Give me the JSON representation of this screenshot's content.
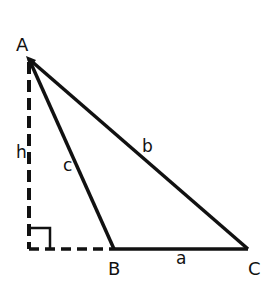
{
  "diagram": {
    "type": "triangle-altitude",
    "colors": {
      "stroke": "#111111",
      "background": "#ffffff"
    },
    "vertices": {
      "A": {
        "label": "A",
        "x": 29,
        "y": 59
      },
      "B": {
        "label": "B",
        "x": 114,
        "y": 249
      },
      "C": {
        "label": "C",
        "x": 248,
        "y": 249
      },
      "H": {
        "x": 29,
        "y": 249
      }
    },
    "sides": {
      "a": {
        "label": "a"
      },
      "b": {
        "label": "b"
      },
      "c": {
        "label": "c"
      },
      "h": {
        "label": "h"
      }
    }
  }
}
